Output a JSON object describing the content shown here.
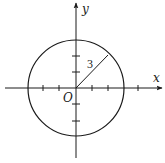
{
  "diagram": {
    "type": "coordinate-circle",
    "axes": {
      "x_label": "x",
      "y_label": "y",
      "origin_label": "O"
    },
    "circle": {
      "center": [
        0,
        0
      ],
      "radius": 3,
      "radius_label": "3"
    },
    "ticks": {
      "x": [
        -2,
        -1,
        1,
        2,
        4
      ],
      "y": [
        -2,
        -1,
        1,
        2
      ]
    },
    "colors": {
      "stroke": "#1a1a1a",
      "background": "#ffffff"
    }
  }
}
